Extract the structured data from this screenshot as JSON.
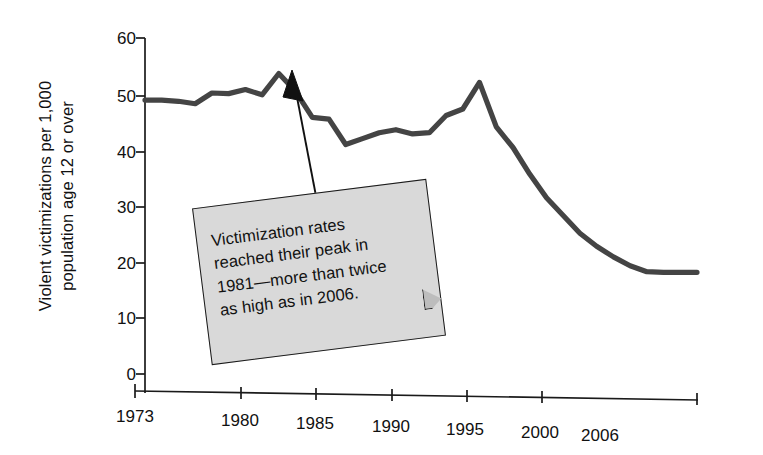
{
  "figure": {
    "background_color": "#ffffff",
    "line_color": "#444444",
    "axis_color": "#1a1a1a",
    "callout_fill": "#d9d9d9",
    "callout_border": "#1a1a1a"
  },
  "axis": {
    "ylabel_line1": "Violent victimizations per 1,000",
    "ylabel_line2": "population age 12 or over",
    "ytick_labels": [
      "60",
      "50",
      "40",
      "30",
      "20",
      "10",
      "0"
    ],
    "xtick_labels": [
      "1973",
      "1980",
      "1985",
      "1990",
      "1995",
      "2000",
      "2006"
    ]
  },
  "annotation": {
    "text": "Victimization rates reached their peak in 1981—more than twice as high as in 2006.",
    "line1": "Victimization rates",
    "line2": "reached their peak in",
    "line3": "1981—more than twice",
    "line4": "as high as in 2006."
  },
  "chart_data": {
    "type": "line",
    "title": "",
    "xlabel": "",
    "ylabel": "Violent victimizations per 1,000 population age 12 or over",
    "xlim": [
      1973,
      2006
    ],
    "ylim": [
      0,
      60
    ],
    "yticks": [
      0,
      10,
      20,
      30,
      40,
      50,
      60
    ],
    "xticks": [
      1973,
      1980,
      1985,
      1990,
      1995,
      2000,
      2006
    ],
    "grid": false,
    "legend": false,
    "x": [
      1973,
      1974,
      1975,
      1976,
      1977,
      1978,
      1979,
      1980,
      1981,
      1982,
      1983,
      1984,
      1985,
      1986,
      1987,
      1988,
      1989,
      1990,
      1991,
      1992,
      1993,
      1994,
      1995,
      1996,
      1997,
      1998,
      1999,
      2000,
      2001,
      2002,
      2003,
      2004,
      2005,
      2006
    ],
    "values": [
      49.5,
      49.5,
      49.3,
      48.9,
      50.7,
      50.6,
      51.3,
      50.4,
      54.0,
      51.0,
      46.6,
      46.3,
      42.0,
      43.0,
      44.0,
      44.5,
      43.8,
      44.0,
      46.9,
      48.0,
      52.5,
      45.0,
      41.5,
      37.0,
      33.0,
      30.0,
      27.0,
      24.8,
      23.0,
      21.5,
      20.5,
      20.4,
      20.4,
      20.4
    ],
    "series": [
      {
        "name": "Violent victimization rate",
        "values": [
          49.5,
          49.5,
          49.3,
          48.9,
          50.7,
          50.6,
          51.3,
          50.4,
          54.0,
          51.0,
          46.6,
          46.3,
          42.0,
          43.0,
          44.0,
          44.5,
          43.8,
          44.0,
          46.9,
          48.0,
          52.5,
          45.0,
          41.5,
          37.0,
          33.0,
          30.0,
          27.0,
          24.8,
          23.0,
          21.5,
          20.5,
          20.4,
          20.4,
          20.4
        ]
      }
    ],
    "annotations": [
      {
        "text": "Victimization rates reached their peak in 1981—more than twice as high as in 2006.",
        "points_to_year": 1981,
        "points_to_value": 54.0
      }
    ]
  }
}
